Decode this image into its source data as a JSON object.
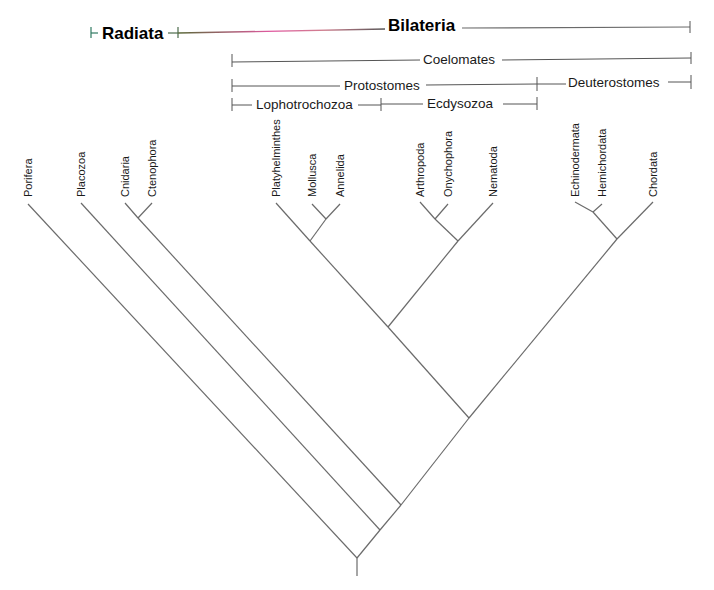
{
  "groups": {
    "radiata": "Radiata",
    "bilateria": "Bilateria",
    "coelomates": "Coelomates",
    "protostomes": "Protostomes",
    "deuterostomes": "Deuterostomes",
    "lophotrochozoa": "Lophotrochozoa",
    "ecdysozoa": "Ecdysozoa"
  },
  "colors": {
    "radiata_line": "#2f7a62",
    "bilateria_line_start": "#5a6b3a",
    "bilateria_line_mid": "#e05aa0",
    "bilateria_line_end": "#555555",
    "branch": "#6b6b6b"
  },
  "taxa": [
    "Porifera",
    "Placozoa",
    "Cnidaria",
    "Ctenophora",
    "Platyhelminthes",
    "Mollusca",
    "Annelida",
    "Arthropoda",
    "Onychophora",
    "Nematoda",
    "Echinodermata",
    "Hemichordata",
    "Chordata"
  ],
  "tree_newick": "(Porifera,(Placozoa,((Cnidaria,Ctenophora),(((Platyhelminthes,(Mollusca,Annelida)),((Arthropoda,Onychophora),Nematoda)),((Echinodermata,Hemichordata),Chordata)))));"
}
